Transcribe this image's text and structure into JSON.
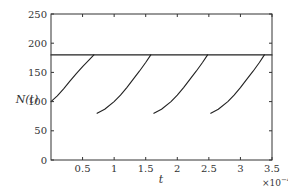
{
  "chart_data": {
    "type": "line",
    "title": "",
    "xlabel": "t",
    "ylabel": "N(t)",
    "x_multiplier": "×10⁻⁴",
    "x_multiplier_base": "×10",
    "x_multiplier_exp": "−4",
    "xlim": [
      0,
      3.5
    ],
    "ylim": [
      0,
      250
    ],
    "grid": false,
    "legend": null,
    "x_ticks": [
      0.5,
      1,
      1.5,
      2,
      2.5,
      3,
      3.5
    ],
    "x_tick_labels": [
      "0.5",
      "1",
      "1.5",
      "2",
      "2.5",
      "3",
      "3.5"
    ],
    "y_ticks": [
      0,
      50,
      100,
      150,
      200,
      250
    ],
    "y_tick_labels": [
      "0",
      "50",
      "100",
      "150",
      "200",
      "250"
    ],
    "series": [
      {
        "name": "threshold",
        "style": "horizontal line",
        "x": [
          0,
          3.5
        ],
        "y": [
          180,
          180
        ]
      },
      {
        "name": "segment-1",
        "x": [
          0.0,
          0.1,
          0.2,
          0.3,
          0.4,
          0.5,
          0.6,
          0.68
        ],
        "y": [
          100,
          110,
          122,
          135,
          148,
          160,
          171,
          180
        ]
      },
      {
        "name": "segment-2",
        "x": [
          0.73,
          0.85,
          1.0,
          1.1,
          1.2,
          1.3,
          1.4,
          1.5,
          1.58
        ],
        "y": [
          80,
          87,
          100,
          111,
          124,
          138,
          152,
          167,
          180
        ]
      },
      {
        "name": "segment-3",
        "x": [
          1.63,
          1.75,
          1.9,
          2.0,
          2.1,
          2.2,
          2.3,
          2.4,
          2.48
        ],
        "y": [
          80,
          87,
          100,
          111,
          124,
          138,
          152,
          167,
          180
        ]
      },
      {
        "name": "segment-4",
        "x": [
          2.53,
          2.65,
          2.8,
          2.9,
          3.0,
          3.1,
          3.2,
          3.3,
          3.38
        ],
        "y": [
          80,
          87,
          100,
          111,
          124,
          138,
          152,
          167,
          180
        ]
      }
    ]
  }
}
